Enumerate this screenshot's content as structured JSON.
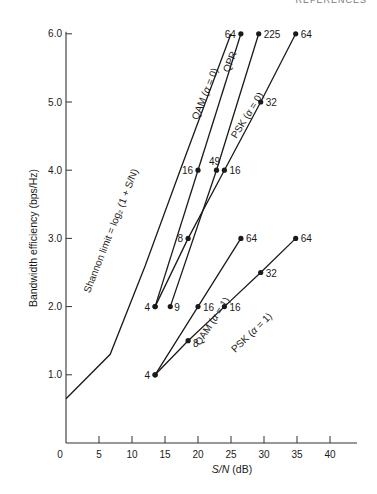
{
  "header": {
    "running_head": "REFERENCES"
  },
  "chart_data": {
    "type": "line",
    "title": "",
    "xlabel": "S/N (dB)",
    "ylabel": "Bandwidth efficiency (bps/Hz)",
    "xlim": [
      0,
      43
    ],
    "ylim": [
      0,
      6.2
    ],
    "xticks": [
      0,
      5,
      10,
      15,
      20,
      25,
      30,
      35,
      40
    ],
    "yticks": [
      1.0,
      2.0,
      3.0,
      4.0,
      5.0,
      6.0
    ],
    "ytick_labels": [
      "1.0",
      "2.0",
      "3.0",
      "4.0",
      "5.0",
      "6.0"
    ],
    "grid": false,
    "legend": "inline labels",
    "series": [
      {
        "name": "Shannon limit = log2 (1 + S/N)",
        "label_text": "Shannon limit = log₂ (1 + S/N)",
        "markers": false,
        "points": [
          [
            0,
            0.65
          ],
          [
            6.7,
            1.3
          ],
          [
            12,
            2.6
          ],
          [
            17.3,
            4.0
          ],
          [
            22.3,
            5.3
          ],
          [
            25,
            6.0
          ]
        ]
      },
      {
        "name": "QAM (α = 0)",
        "markers": true,
        "points": [
          [
            13.5,
            2.0,
            "4"
          ],
          [
            20,
            4.0,
            "16"
          ],
          [
            26.5,
            6.0,
            "64"
          ]
        ]
      },
      {
        "name": "QPR",
        "markers": true,
        "points": [
          [
            15.8,
            2.0,
            "9"
          ],
          [
            22.8,
            4.0,
            "49"
          ],
          [
            29.2,
            6.0,
            "225"
          ]
        ]
      },
      {
        "name": "PSK (α = 0)",
        "markers": true,
        "points": [
          [
            13.5,
            2.0,
            "4"
          ],
          [
            18.5,
            3.0,
            "8"
          ],
          [
            24,
            4.0,
            "16"
          ],
          [
            29.5,
            5.0,
            "32"
          ],
          [
            34.8,
            6.0,
            "64"
          ]
        ]
      },
      {
        "name": "QAM (α = 1)",
        "markers": true,
        "points": [
          [
            13.5,
            1.0,
            "4"
          ],
          [
            20,
            2.0,
            "16"
          ],
          [
            26.5,
            3.0,
            "64"
          ]
        ]
      },
      {
        "name": "PSK (α = 1)",
        "markers": true,
        "points": [
          [
            13.5,
            1.0,
            "4"
          ],
          [
            18.5,
            1.5,
            "8"
          ],
          [
            24,
            2.0,
            "16"
          ],
          [
            29.5,
            2.5,
            "32"
          ],
          [
            34.8,
            3.0,
            "64"
          ]
        ]
      }
    ],
    "annotations": [
      "8 (QAM α=0 / PSK α=0 intersection near 18.5 dB, 3.0)"
    ]
  }
}
